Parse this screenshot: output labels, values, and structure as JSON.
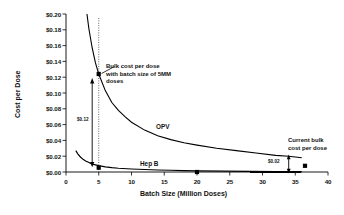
{
  "chart_data": {
    "type": "line",
    "title": "",
    "xlabel": "Batch Size (Million Doses)",
    "ylabel": "Cost per Dose",
    "xlim": [
      0,
      40
    ],
    "ylim": [
      0,
      0.2
    ],
    "grid": false,
    "legend_position": "inline-labels",
    "xticks": [
      "0",
      "5",
      "10",
      "15",
      "20",
      "25",
      "30",
      "35",
      "40"
    ],
    "xtick_values": [
      0,
      5,
      10,
      15,
      20,
      25,
      30,
      35,
      40
    ],
    "yticks": [
      "$0.00",
      "$0.02",
      "$0.04",
      "$0.06",
      "$0.08",
      "$0.10",
      "$0.12",
      "$0.14",
      "$0.16",
      "$0.18",
      "$0.20"
    ],
    "ytick_values": [
      0.0,
      0.02,
      0.04,
      0.06,
      0.08,
      0.1,
      0.12,
      0.14,
      0.16,
      0.18,
      0.2
    ],
    "series": [
      {
        "name": "OPV",
        "x": [
          3.2,
          3.5,
          4.0,
          4.5,
          5.0,
          6.0,
          7.0,
          8.0,
          9.0,
          10.0,
          12.0,
          14.0,
          16.0,
          18.0,
          20.0,
          23.0,
          26.0,
          29.0,
          32.0,
          34.0,
          36.0
        ],
        "values": [
          0.2,
          0.181,
          0.157,
          0.138,
          0.124,
          0.103,
          0.088,
          0.078,
          0.07,
          0.063,
          0.053,
          0.046,
          0.041,
          0.037,
          0.034,
          0.03,
          0.027,
          0.024,
          0.021,
          0.02,
          0.018
        ],
        "markers": [
          {
            "x": 5,
            "y": 0.124
          },
          {
            "x": 36,
            "y": 0.018
          }
        ]
      },
      {
        "name": "Hep B",
        "x": [
          1.5,
          1.8,
          2.2,
          2.6,
          3.0,
          3.5,
          4.0,
          4.5,
          5.0,
          6.0,
          7.0,
          8.0,
          10.0,
          12.0,
          14.0,
          16.0,
          18.0,
          20.0,
          24.0,
          28.0,
          32.0,
          36.0
        ],
        "values": [
          0.027,
          0.023,
          0.019,
          0.016,
          0.014,
          0.012,
          0.01,
          0.009,
          0.008,
          0.0065,
          0.0055,
          0.0048,
          0.0038,
          0.0031,
          0.0026,
          0.0022,
          0.0018,
          0.0015,
          0.0011,
          0.0008,
          0.0006,
          0.0005
        ],
        "markers": [
          {
            "x": 5,
            "y": 0.008
          },
          {
            "x": 20,
            "y": 0.0015
          }
        ]
      }
    ],
    "annotations": [
      {
        "id": "bulk-cost-note",
        "text_lines": [
          "Bulk cost per dose",
          "with batch size of 5MM",
          "doses"
        ],
        "points_to": {
          "x": 5,
          "y": 0.124
        }
      },
      {
        "id": "current-bulk-note",
        "text_lines": [
          "Current bulk",
          "cost per dose"
        ],
        "points_to": {
          "x": 36,
          "y": 0.018
        }
      },
      {
        "id": "delta-left",
        "text": "$0.12",
        "at_x": 4,
        "span_y": [
          0.01,
          0.115
        ]
      },
      {
        "id": "delta-right",
        "text": "$0.02",
        "at_x": 34,
        "span_y": [
          0.0,
          0.019
        ]
      },
      {
        "id": "reference-line",
        "text": "",
        "at_x": 5,
        "style": "dotted-vertical"
      }
    ],
    "series_label_opv": "OPV",
    "series_label_hepb": "Hep B"
  }
}
